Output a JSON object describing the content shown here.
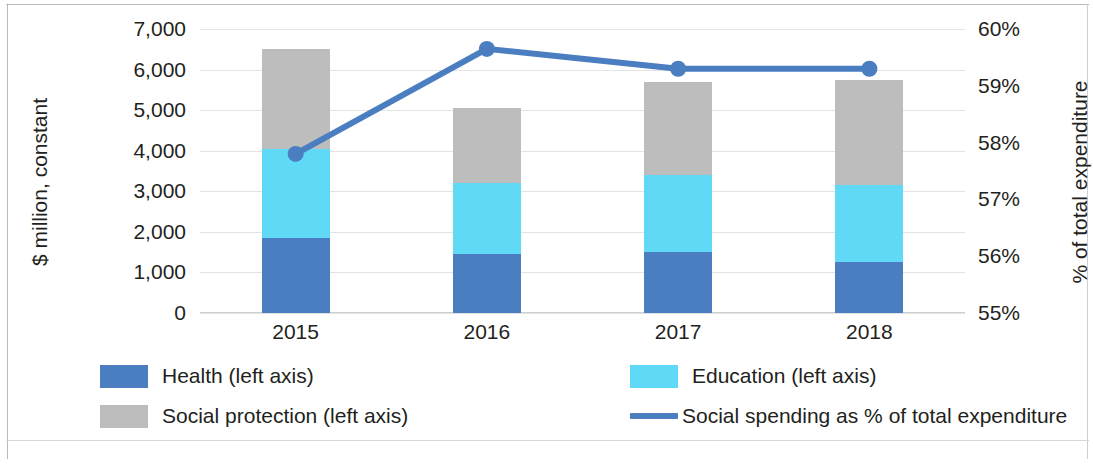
{
  "chart_data": {
    "type": "bar",
    "subtype": "stacked-bar-with-line-combo",
    "title": "",
    "xlabel": "",
    "ylabel": "$ million, constant",
    "y2label": "% of total expenditure",
    "categories": [
      "2015",
      "2016",
      "2017",
      "2018"
    ],
    "ylim": [
      0,
      7000
    ],
    "yticks": [
      "0",
      "1,000",
      "2,000",
      "3,000",
      "4,000",
      "5,000",
      "6,000",
      "7,000"
    ],
    "ytick_values": [
      0,
      1000,
      2000,
      3000,
      4000,
      5000,
      6000,
      7000
    ],
    "y2lim": [
      55,
      60
    ],
    "y2ticks": [
      "55%",
      "56%",
      "57%",
      "58%",
      "59%",
      "60%"
    ],
    "y2tick_values": [
      55,
      56,
      57,
      58,
      59,
      60
    ],
    "grid": true,
    "legend_position": "bottom",
    "series": [
      {
        "name": "Health (left axis)",
        "axis": "left",
        "kind": "bar",
        "color": "#4a7ec0",
        "values": [
          1850,
          1450,
          1500,
          1250
        ]
      },
      {
        "name": "Education (left axis)",
        "axis": "left",
        "kind": "bar",
        "color": "#5fd9f5",
        "values": [
          2200,
          1750,
          1900,
          1900
        ]
      },
      {
        "name": "Social protection (left axis)",
        "axis": "left",
        "kind": "bar",
        "color": "#bdbdbd",
        "values": [
          2450,
          1850,
          2300,
          2600
        ]
      },
      {
        "name": "Social spending as % of total expenditure",
        "axis": "right",
        "kind": "line",
        "color": "#4a7ec0",
        "values": [
          57.8,
          59.65,
          59.3,
          59.3
        ]
      }
    ],
    "totals": [
      6500,
      5050,
      5700,
      5750
    ]
  },
  "axes": {
    "left_title": "$ million, constant",
    "right_title": "% of total expenditure"
  },
  "legend": {
    "items": [
      {
        "label": "Health (left axis)",
        "marker": "square-swatch",
        "color": "#4a7ec0"
      },
      {
        "label": "Education (left axis)",
        "marker": "square-swatch",
        "color": "#5fd9f5"
      },
      {
        "label": "Social protection (left axis)",
        "marker": "square-swatch",
        "color": "#bdbdbd"
      },
      {
        "label": "Social spending as % of total expenditure",
        "marker": "line-swatch",
        "color": "#4a7ec0"
      }
    ]
  }
}
